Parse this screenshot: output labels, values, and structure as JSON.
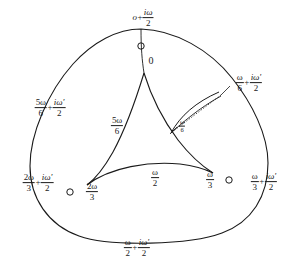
{
  "figure": {
    "stroke_color": "#1a1a1a",
    "background_color": "#ffffff",
    "marker_shape": "open-circle",
    "marker_count": 3
  },
  "outer_boundary_labels": [
    {
      "id": "top",
      "text": "o + iω/2",
      "parts": {
        "lead": "o",
        "op": "+",
        "num": "iω",
        "den": "2"
      },
      "x": 143,
      "y": 18
    },
    {
      "id": "upper-left",
      "text": "5ω/6 + iω'/2",
      "parts": {
        "num1": "5ω",
        "den1": "6",
        "op": "+",
        "num2": "iω'",
        "den2": "2"
      },
      "x": 50,
      "y": 108
    },
    {
      "id": "upper-right",
      "text": "ω/6 + iω'/2",
      "parts": {
        "num1": "ω",
        "den1": "6",
        "op": "+",
        "num2": "iω'",
        "den2": "2"
      },
      "x": 249,
      "y": 83
    },
    {
      "id": "lower-left",
      "text": "2ω/3 + iω'/2",
      "parts": {
        "num1": "2ω",
        "den1": "3",
        "op": "+",
        "num2": "iω'",
        "den2": "2"
      },
      "x": 38,
      "y": 183
    },
    {
      "id": "lower-right",
      "text": "ω/3 + iω'/2",
      "parts": {
        "num1": "ω",
        "den1": "3",
        "op": "+",
        "num2": "iω'",
        "den2": "2"
      },
      "x": 264,
      "y": 182
    },
    {
      "id": "bottom",
      "text": "ω/2 + iω'/2",
      "parts": {
        "num1": "ω",
        "den1": "2",
        "op": "+",
        "num2": "iω'",
        "den2": "2"
      },
      "x": 137,
      "y": 248
    }
  ],
  "interior_labels": [
    {
      "id": "origin",
      "text": "0",
      "x": 151,
      "y": 61
    },
    {
      "id": "five-omega-six",
      "text": "5ω/6",
      "parts": {
        "num": "5ω",
        "den": "6"
      },
      "x": 117,
      "y": 126
    },
    {
      "id": "omega-six",
      "text": "ω/6",
      "parts": {
        "num": "ω",
        "den": "6"
      },
      "x": 182,
      "y": 126
    },
    {
      "id": "two-omega-three",
      "text": "2ω/3",
      "parts": {
        "num": "2ω",
        "den": "3"
      },
      "x": 92,
      "y": 192
    },
    {
      "id": "omega-two",
      "text": "ω/2",
      "parts": {
        "num": "ω",
        "den": "2"
      },
      "x": 155,
      "y": 178
    },
    {
      "id": "omega-three",
      "text": "ω/3",
      "parts": {
        "num": "ω",
        "den": "3"
      },
      "x": 210,
      "y": 180
    }
  ],
  "markers": [
    {
      "id": "marker-top",
      "x": 141,
      "y": 46
    },
    {
      "id": "marker-bottom-left",
      "x": 70,
      "y": 192
    },
    {
      "id": "marker-bottom-right",
      "x": 229,
      "y": 180
    }
  ],
  "cusps": [
    {
      "id": "cusp-top",
      "label": "0",
      "x": 144,
      "y": 73
    },
    {
      "id": "cusp-bottom-left",
      "label": "2ω/3",
      "x": 87,
      "y": 185
    },
    {
      "id": "cusp-bottom-right",
      "label": "ω/3",
      "x": 213,
      "y": 173
    }
  ]
}
